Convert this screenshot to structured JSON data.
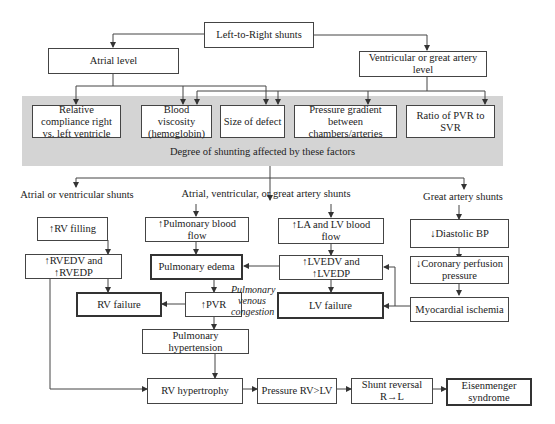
{
  "diagram": {
    "root": "Left-to-Right shunts",
    "levels": {
      "atrial": "Atrial level",
      "ventricular": "Ventricular or great artery level"
    },
    "factors": [
      {
        "id": "compliance",
        "label": "Relative compliance right vs. left ventricle"
      },
      {
        "id": "viscosity",
        "label": "Blood viscosity (hemoglobin)"
      },
      {
        "id": "defect_size",
        "label": "Size of defect"
      },
      {
        "id": "pressure_gradient",
        "label": "Pressure gradient between chambers/arteries"
      },
      {
        "id": "pvr_svr",
        "label": "Ratio of PVR to SVR"
      }
    ],
    "factors_caption": "Degree of shunting affected by these factors",
    "shunt_groups": {
      "left": "Atrial or ventricular shunts",
      "middle": "Atrial, ventricular, or great artery shunts",
      "right": "Great artery shunts"
    },
    "nodes": {
      "rv_filling": "↑RV filling",
      "pulm_blood_flow": "↑Pulmonary blood flow",
      "la_lv_flow": "↑LA and LV blood flow",
      "diastolic_bp": "↓Diastolic BP",
      "rvedv": "↑RVEDV and ↑RVEDP",
      "pulm_edema": "Pulmonary edema",
      "lvedv": "↑LVEDV and ↑LVEDP",
      "coronary_perfusion": "↓Coronary perfusion pressure",
      "rv_failure": "RV failure",
      "pvr": "↑PVR",
      "lv_failure": "LV failure",
      "myocardial_ischemia": "Myocardial ischemia",
      "pulm_hypertension": "Pulmonary hypertension",
      "rv_hypertrophy": "RV hypertrophy",
      "pressure_rv_lv": "Pressure RV>LV",
      "shunt_reversal": "Shunt reversal R→L",
      "eisenmenger": "Eisenmenger syndrome"
    },
    "annotation": "Pulmonary venous congestion"
  }
}
